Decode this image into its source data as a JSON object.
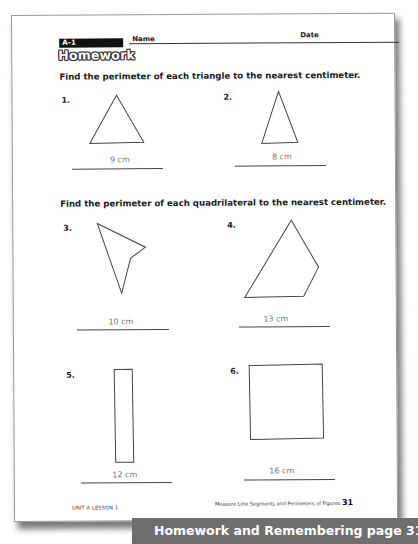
{
  "page": {
    "top_cut_text": "ercising Perimeter",
    "header": {
      "lesson_code": "A–1",
      "name_label": "Name",
      "date_label": "Date",
      "title": "Homework"
    },
    "sections": [
      {
        "instruction": "Find the perimeter of each triangle to the nearest centimeter.",
        "problems": [
          {
            "number": "1.",
            "shape": "triangle",
            "answer": "9 cm"
          },
          {
            "number": "2.",
            "shape": "triangle",
            "answer": "8 cm"
          }
        ]
      },
      {
        "instruction": "Find the perimeter of each quadrilateral to the nearest centimeter.",
        "problems": [
          {
            "number": "3.",
            "shape": "concave-quadrilateral",
            "answer": "10 cm"
          },
          {
            "number": "4.",
            "shape": "quadrilateral",
            "answer": "13 cm"
          },
          {
            "number": "5.",
            "shape": "rectangle",
            "answer": "12 cm"
          },
          {
            "number": "6.",
            "shape": "square",
            "answer": "16 cm"
          }
        ]
      }
    ],
    "footer": {
      "left": "UNIT A LESSON 1",
      "right": "Measure Line Segments and Perimeters of Figures",
      "page_number": "31"
    }
  },
  "banner": {
    "text": "Homework and Remembering page 31",
    "background": "#6e6e6e",
    "color": "#ffffff"
  }
}
